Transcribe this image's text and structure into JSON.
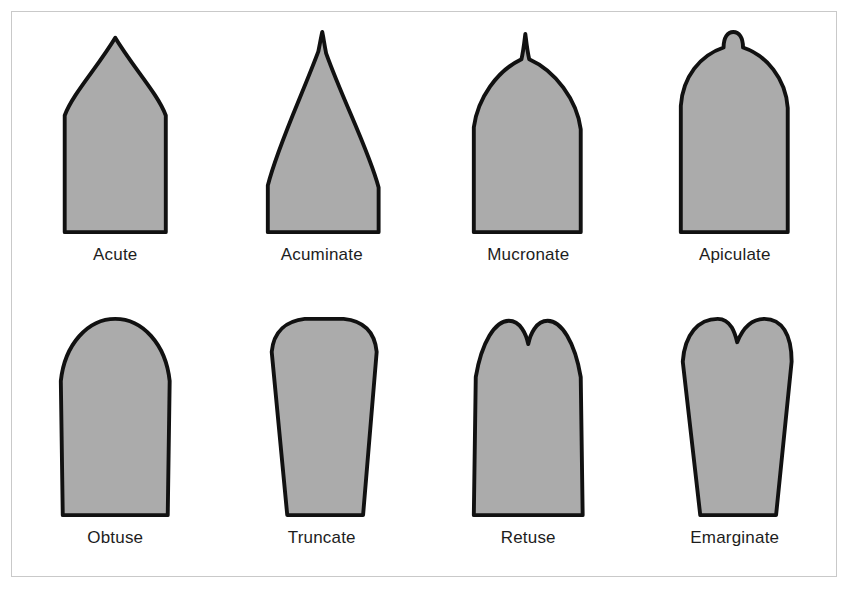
{
  "figure": {
    "background_color": "#ffffff",
    "frame_border_color": "#c9c9c9",
    "shape_fill_color": "#ababab",
    "shape_outline_color": "#111111",
    "label_color": "#1d1d1d",
    "rows": 2,
    "columns": 4
  },
  "diagram_data": {
    "type": "diagram",
    "subject": "leaf-apex-morphology",
    "items": [
      {
        "id": "acute",
        "label": "Acute",
        "row": 1,
        "column": 1,
        "apex_description": "Tapering to a sharp point with straight to slightly convex sides meeting at an angle less than 90 degrees",
        "apex_tip": "sharp-point",
        "outline": "M 10 208 L 10 88 C 18 66 44 38 62 8 C 80 38 106 66 114 88 L 114 208 Z"
      },
      {
        "id": "acuminate",
        "label": "Acuminate",
        "row": 1,
        "column": 2,
        "apex_description": "Drawn out into a long slender tapering tip with concave sides",
        "apex_tip": "long-drawn-point",
        "outline": "M 6 208 L 6 160 C 16 120 40 70 58 22 C 60 12 61 6 62 2 C 63 6 64 14 66 24 C 84 74 110 124 120 162 L 120 208 Z"
      },
      {
        "id": "mucronate",
        "label": "Mucronate",
        "row": 1,
        "column": 3,
        "apex_description": "Rounded or blunt apex abruptly terminated by a short sharp bristle-like spine",
        "apex_tip": "short-sharp-spine",
        "outline": "M 6 208 L 6 100 C 10 70 30 42 55 30 C 57 22 58 12 59 4 C 60 12 61 22 63 30 C 90 42 112 72 116 102 L 116 208 Z"
      },
      {
        "id": "apiculate",
        "label": "Apiculate",
        "row": 1,
        "column": 4,
        "apex_description": "Broadly rounded apex ending in a small short flexible rounded nub or point",
        "apex_tip": "small-rounded-nub",
        "outline": "M 6 208 L 6 78 C 8 48 26 26 50 18 C 50 8 54 2 60 2 C 66 2 70 8 70 18 C 94 26 114 50 116 80 L 116 208 Z"
      },
      {
        "id": "obtuse",
        "label": "Obtuse",
        "row": 2,
        "column": 1,
        "apex_description": "Broadly rounded apex forming a blunt angle greater than 90 degrees",
        "apex_tip": "broadly-rounded",
        "outline": "M 8 208 L 6 70 C 10 32 34 6 62 6 C 90 6 114 32 118 70 L 116 208 Z"
      },
      {
        "id": "truncate",
        "label": "Truncate",
        "row": 2,
        "column": 2,
        "apex_description": "Apex ending abruptly in a nearly straight flat edge, as though cut off squarely",
        "apex_tip": "flat-cut-off",
        "outline": "M 26 208 L 10 40 C 12 18 26 8 44 6 L 84 6 C 104 8 116 18 118 40 L 104 208 Z"
      },
      {
        "id": "retuse",
        "label": "Retuse",
        "row": 2,
        "column": 3,
        "apex_description": "Rounded apex with a small shallow notch cut into the tip forming two rounded lobes",
        "apex_tip": "small-notch",
        "outline": "M 6 208 L 8 66 C 14 30 28 8 42 8 C 54 8 60 22 62 32 C 64 22 70 8 82 8 C 96 8 110 30 116 66 L 118 208 Z"
      },
      {
        "id": "emarginate",
        "label": "Emarginate",
        "row": 2,
        "column": 4,
        "apex_description": "Apex with a broad conspicuous shallow notch indenting the rounded tip",
        "apex_tip": "broad-notch",
        "outline": "M 26 208 L 8 50 C 10 22 24 6 44 6 C 58 6 62 22 64 30 C 68 20 76 6 92 6 C 110 6 120 22 120 50 L 104 208 Z"
      }
    ]
  }
}
